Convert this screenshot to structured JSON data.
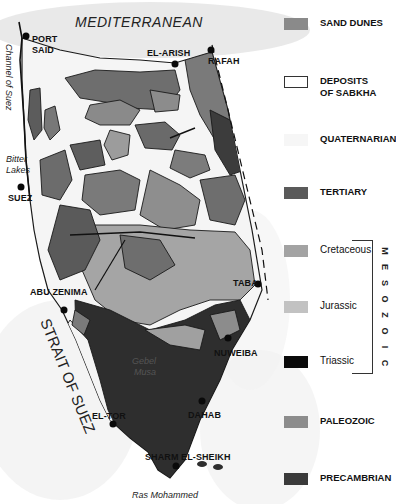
{
  "map": {
    "title_sea": "MEDITERRANEAN",
    "water_labels": {
      "channel": "Channel of Suez",
      "bitter_lakes_1": "Bitter",
      "bitter_lakes_2": "Lakes",
      "strait": "STRAIT OF SUEZ",
      "ras": "Ras Mohammed"
    },
    "mountain_label_1": "Gebel",
    "mountain_label_2": "Musa",
    "cities": [
      {
        "name": "PORT",
        "name2": "SAID"
      },
      {
        "name": "EL-ARISH"
      },
      {
        "name": "RAFAH"
      },
      {
        "name": "SUEZ"
      },
      {
        "name": "ABU ZENIMA"
      },
      {
        "name": "TABA"
      },
      {
        "name": "NUWEIBA"
      },
      {
        "name": "EL-TOR"
      },
      {
        "name": "DAHAB"
      },
      {
        "name": "SHARM EL-SHEIKH"
      }
    ]
  },
  "legend": {
    "items": [
      {
        "label": "SAND DUNES",
        "color": "#8a8a8a"
      },
      {
        "label": "DEPOSITS",
        "label2": "OF SABKHA",
        "color": "#ffffff"
      },
      {
        "label": "QUATERNARIAN",
        "color": "#f6f6f6"
      },
      {
        "label": "TERTIARY",
        "color": "#5a5a5a"
      },
      {
        "label": "Cretaceous",
        "color": "#a3a3a3"
      },
      {
        "label": "Jurassic",
        "color": "#c2c2c2"
      },
      {
        "label": "Triassic",
        "color": "#0a0a0a"
      },
      {
        "label": "PALEOZOIC",
        "color": "#8c8c8c"
      },
      {
        "label": "PRECAMBRIAN",
        "color": "#3a3a3a"
      }
    ],
    "era_group": "MESOZOIC",
    "era_letters": [
      "M",
      "E",
      "S",
      "O",
      "Z",
      "O",
      "I",
      "C"
    ]
  },
  "colors": {
    "sea_shade": "#e6e6e6",
    "quaternary": "#f4f4f4",
    "tertiary": "#6a6a6a",
    "cretaceous": "#8f8f8f",
    "jurassic": "#adadad",
    "precambrian": "#2e2e2e",
    "outline": "#1a1a1a"
  }
}
